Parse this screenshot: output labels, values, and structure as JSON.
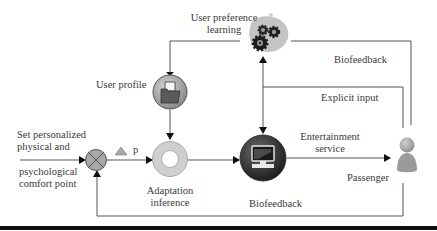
{
  "diagram": {
    "nodes": {
      "user_preference_learning": {
        "label_line1": "User preference",
        "label_line2": "learning",
        "icon": "gears-icon"
      },
      "user_profile": {
        "label": "User profile",
        "icon": "folder-icon"
      },
      "comparator": {
        "icon": "summing-junction-icon"
      },
      "delta_p": {
        "symbol": "p",
        "icon": "delta-triangle-icon"
      },
      "adaptation_inference": {
        "label_line1": "Adaptation",
        "label_line2": "inference",
        "icon": "ring-icon"
      },
      "entertainment_system": {
        "icon": "computer-monitor-icon"
      },
      "passenger": {
        "label": "Passenger",
        "icon": "person-icon"
      }
    },
    "input": {
      "line1": "Set personalized",
      "line2": "physical and",
      "line3": "psychological",
      "line4": "comfort point"
    },
    "edges": {
      "biofeedback_top": "Biofeedback",
      "explicit_input": "Explicit input",
      "entertainment_line1": "Entertainment",
      "entertainment_line2": "service",
      "biofeedback_bottom": "Biofeedback"
    },
    "colors": {
      "line": "#555555",
      "node_gray": "#a8a8a8",
      "node_dark": "#3b3b3b",
      "ring": "#cfcfcf",
      "rule": "#111111"
    }
  }
}
